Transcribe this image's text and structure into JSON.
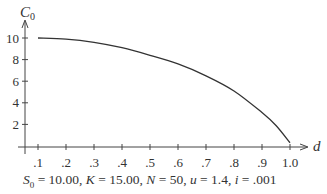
{
  "chart_data": {
    "type": "line",
    "title": "",
    "xlabel": "d",
    "ylabel": "C_0",
    "xlim": [
      0.05,
      1.05
    ],
    "ylim": [
      0,
      11
    ],
    "grid": false,
    "legend": null,
    "x_ticks": [
      ".1",
      ".2",
      ".3",
      ".4",
      ".5",
      ".6",
      ".7",
      ".8",
      ".9",
      "1.0"
    ],
    "y_ticks": [
      "2",
      "4",
      "6",
      "8",
      "10"
    ],
    "series": [
      {
        "name": "C_0",
        "x": [
          0.1,
          0.2,
          0.3,
          0.4,
          0.5,
          0.6,
          0.7,
          0.8,
          0.9,
          0.95,
          1.0
        ],
        "values": [
          10.0,
          9.9,
          9.6,
          9.1,
          8.4,
          7.6,
          6.5,
          5.1,
          3.1,
          1.9,
          0.3
        ]
      }
    ],
    "annotation": "S_0 = 10.00, K = 15.00, N = 50, u = 1.4, i = .001"
  },
  "caption": {
    "s0_label": "S",
    "s0_sub": "0",
    "s0_value": " = 10.00, ",
    "k_label": "K",
    "k_value": " = 15.00, ",
    "n_label": "N",
    "n_value": " = 50, ",
    "u_label": "u",
    "u_value": " = 1.4, ",
    "i_label": "i",
    "i_value": " = .001"
  },
  "axes": {
    "y_label_main": "C",
    "y_label_sub": "0",
    "x_label": "d"
  }
}
